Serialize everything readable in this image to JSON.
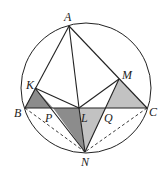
{
  "diagram": {
    "type": "geometry",
    "colors": {
      "stroke": "#222222",
      "shade_dark": "#8c8c8c",
      "shade_light": "#c2c2c2",
      "background": "#ffffff"
    },
    "circle": {
      "cx": 86,
      "cy": 88,
      "r": 65
    },
    "points": {
      "A": {
        "x": 69,
        "y": 26,
        "label": "A",
        "lx": 64,
        "ly": 21
      },
      "B": {
        "x": 25,
        "y": 108,
        "label": "B",
        "lx": 14,
        "ly": 117
      },
      "C": {
        "x": 147,
        "y": 108,
        "label": "C",
        "lx": 149,
        "ly": 116
      },
      "K": {
        "x": 35,
        "y": 88,
        "label": "K",
        "lx": 26,
        "ly": 89
      },
      "M": {
        "x": 119,
        "y": 79,
        "label": "M",
        "lx": 122,
        "ly": 79
      },
      "L": {
        "x": 79,
        "y": 108,
        "label": "L",
        "lx": 81,
        "ly": 122
      },
      "P": {
        "x": 53,
        "y": 108,
        "label": "P",
        "lx": 45,
        "ly": 122
      },
      "Q": {
        "x": 106,
        "y": 108,
        "label": "Q",
        "lx": 104,
        "ly": 122
      },
      "N": {
        "x": 85,
        "y": 152,
        "label": "N",
        "lx": 81,
        "ly": 166
      }
    },
    "segments_solid": [
      [
        "A",
        "B"
      ],
      [
        "A",
        "C"
      ],
      [
        "A",
        "L"
      ],
      [
        "B",
        "C"
      ],
      [
        "K",
        "L"
      ],
      [
        "M",
        "L"
      ],
      [
        "K",
        "N"
      ],
      [
        "M",
        "N"
      ],
      [
        "L",
        "N"
      ]
    ],
    "segments_dashed": [
      [
        "B",
        "N"
      ],
      [
        "C",
        "N"
      ]
    ],
    "shaded_triangles": [
      {
        "vertices": [
          "K",
          "B",
          "P"
        ],
        "shade": "dark"
      },
      {
        "vertices": [
          "P",
          "L",
          "N"
        ],
        "shade": "dark"
      },
      {
        "vertices": [
          "L",
          "Q",
          "N"
        ],
        "shade": "light"
      },
      {
        "vertices": [
          "Q",
          "M",
          "C"
        ],
        "shade": "light"
      }
    ]
  }
}
